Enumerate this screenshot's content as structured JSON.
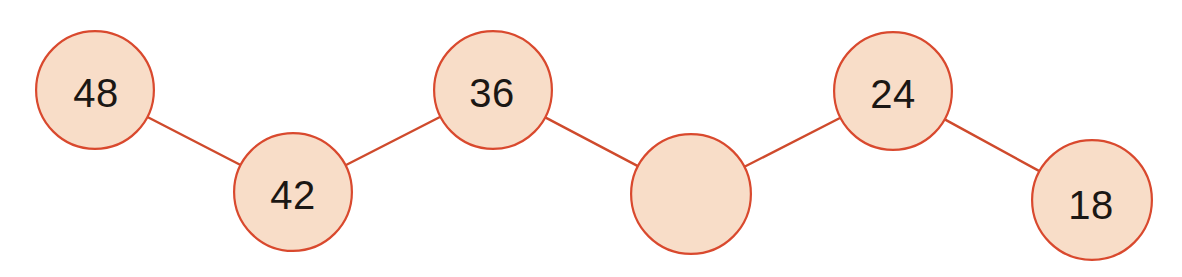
{
  "diagram": {
    "type": "number-chain",
    "title": "",
    "background_color": "#ffffff",
    "node_fill_color": "#f8ddc8",
    "node_stroke_color": "#d9492e",
    "connector_color": "#cf4a2c",
    "label_color": "#1b1714",
    "node_stroke_width": 2.2,
    "connector_width": 2.4,
    "nodes": [
      {
        "id": "node-1",
        "label": "48",
        "filled": true,
        "cx": 95,
        "cy": 90,
        "r": 60
      },
      {
        "id": "node-2",
        "label": "42",
        "filled": true,
        "cx": 293,
        "cy": 192,
        "r": 60
      },
      {
        "id": "node-3",
        "label": "36",
        "filled": true,
        "cx": 493,
        "cy": 90,
        "r": 60
      },
      {
        "id": "node-4",
        "label": "",
        "filled": false,
        "cx": 691,
        "cy": 194,
        "r": 61
      },
      {
        "id": "node-5",
        "label": "24",
        "filled": true,
        "cx": 893,
        "cy": 91,
        "r": 60
      },
      {
        "id": "node-6",
        "label": "18",
        "filled": true,
        "cx": 1092,
        "cy": 200,
        "r": 61
      }
    ],
    "label_offsets": [
      {
        "dx": 1,
        "dy": 3
      },
      {
        "dx": 0,
        "dy": 3
      },
      {
        "dx": -1,
        "dy": 3
      },
      {
        "dx": 0,
        "dy": 0
      },
      {
        "dx": 0,
        "dy": 3
      },
      {
        "dx": -1,
        "dy": 5
      }
    ],
    "connectors": [
      {
        "id": "edge-1-2",
        "from": "node-1",
        "to": "node-2"
      },
      {
        "id": "edge-2-3",
        "from": "node-2",
        "to": "node-3"
      },
      {
        "id": "edge-3-4",
        "from": "node-3",
        "to": "node-4"
      },
      {
        "id": "edge-4-5",
        "from": "node-4",
        "to": "node-5"
      },
      {
        "id": "edge-5-6",
        "from": "node-5",
        "to": "node-6"
      }
    ],
    "sequence_values": [
      48,
      42,
      36,
      null,
      24,
      18
    ],
    "common_difference": -6
  }
}
